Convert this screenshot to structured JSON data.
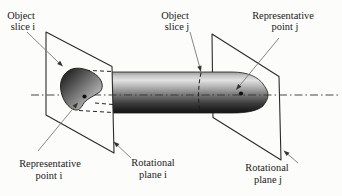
{
  "figure_type": "technical-diagram",
  "labels": {
    "object_slice_i": {
      "line1": "Object",
      "line2": "slice i"
    },
    "object_slice_j": {
      "line1": "Object",
      "line2": "slice j"
    },
    "representative_point_j": {
      "line1": "Representative",
      "line2": "point j"
    },
    "representative_point_i": {
      "line1": "Representative",
      "line2": "point i"
    },
    "rotational_plane_i": {
      "line1": "Rotational",
      "line2": "plane i"
    },
    "rotational_plane_j": {
      "line1": "Rotational",
      "line2": "plane j"
    }
  },
  "icons": {
    "point_marker": "filled-dot",
    "arrowhead": "filled-triangle"
  },
  "colors": {
    "background": "#fcfcfa",
    "ink": "#2a2a2a",
    "leader_line": "#787878",
    "arrowhead_fill": "#333333",
    "plane_fill": "#fcfcfa",
    "object_highlight": "#e2e2e2",
    "object_shadow": "#161616",
    "slice_dark": "#1f1f1f",
    "slice_light": "#dadada"
  }
}
